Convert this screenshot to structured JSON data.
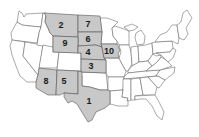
{
  "map": {
    "title": "",
    "colors": {
      "highlight_fill": "#c8c8c8",
      "base_fill": "#ffffff",
      "border": "#555555",
      "label": "#1a1a1a"
    },
    "highlighted_states": [
      {
        "rank": "1",
        "state": "Texas"
      },
      {
        "rank": "2",
        "state": "Montana"
      },
      {
        "rank": "3",
        "state": "Kansas"
      },
      {
        "rank": "4",
        "state": "Nebraska"
      },
      {
        "rank": "5",
        "state": "New Mexico"
      },
      {
        "rank": "6",
        "state": "South Dakota"
      },
      {
        "rank": "7",
        "state": "North Dakota"
      },
      {
        "rank": "8",
        "state": "Arizona"
      },
      {
        "rank": "9",
        "state": "Wyoming"
      },
      {
        "rank": "10",
        "state": "Iowa"
      }
    ]
  }
}
